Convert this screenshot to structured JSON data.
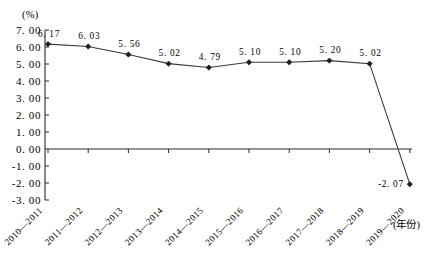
{
  "chart_data": {
    "type": "line",
    "title": "",
    "subtitle": "",
    "xlabel": "(年份)",
    "ylabel": "(%)",
    "categories": [
      "2010—2011",
      "2011—2012",
      "2012—2013",
      "2013—2014",
      "2014—2015",
      "2015—2016",
      "2016—2017",
      "2017—2018",
      "2018—2019",
      "2019—2020"
    ],
    "values": [
      6.17,
      6.03,
      5.56,
      5.02,
      4.79,
      5.1,
      5.1,
      5.2,
      5.02,
      -2.07
    ],
    "point_labels": [
      "6. 17",
      "6. 03",
      "5. 56",
      "5. 02",
      "4. 79",
      "5. 10",
      "5. 10",
      "5. 20",
      "5. 02",
      "-2. 07"
    ],
    "ylim": [
      -3.0,
      7.0
    ],
    "ystep": 1.0,
    "ytick_labels": [
      "7. 00",
      "6. 00",
      "5. 00",
      "4. 00",
      "3. 00",
      "2. 00",
      "1. 00",
      "0. 00",
      "-1. 00",
      "-2. 00",
      "-3. 00"
    ],
    "ytick_values": [
      7,
      6,
      5,
      4,
      3,
      2,
      1,
      0,
      -1,
      -2,
      -3
    ],
    "grid": false,
    "legend": [],
    "legend_position": "none",
    "marker": "diamond",
    "series_color": "#3a3a3a",
    "axis_color": "#2b2b2b",
    "background": "#ffffff",
    "xtick_rotation_deg": -45
  }
}
